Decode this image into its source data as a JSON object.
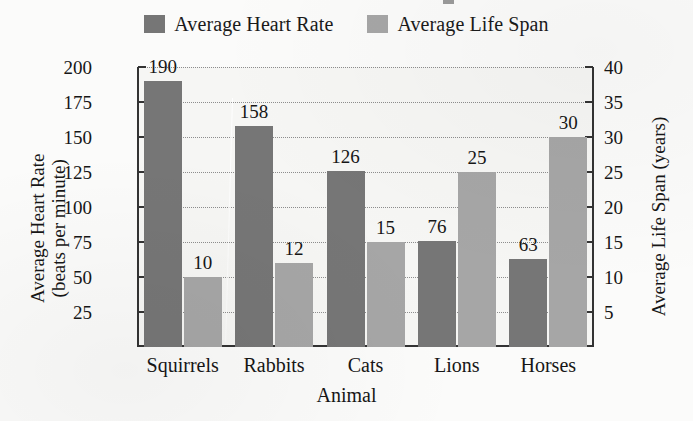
{
  "chart_data": {
    "type": "bar",
    "title": "",
    "xlabel": "Animal",
    "ylabel": "Average Heart Rate\n(beats per minute)",
    "ylabel_line1": "Average Heart Rate",
    "ylabel_line2": "(beats per minute)",
    "y2label": "Average Life Span (years)",
    "categories": [
      "Squirrels",
      "Rabbits",
      "Cats",
      "Lions",
      "Horses"
    ],
    "series": [
      {
        "name": "Average Heart Rate",
        "axis": "left",
        "unit": "beats per minute",
        "color": "#767676",
        "values": [
          190,
          158,
          126,
          76,
          63
        ]
      },
      {
        "name": "Average Life Span",
        "axis": "right",
        "unit": "years",
        "color": "#a6a6a6",
        "values": [
          10,
          12,
          15,
          25,
          30
        ]
      }
    ],
    "ylim": [
      0,
      200
    ],
    "yticks": [
      25,
      50,
      75,
      100,
      125,
      150,
      175,
      200
    ],
    "y2lim": [
      0,
      40
    ],
    "y2ticks": [
      5,
      10,
      15,
      20,
      25,
      30,
      35,
      40
    ],
    "grid": true,
    "grid_style": "dotted",
    "legend_position": "top-center",
    "data_labels": true,
    "plot_background": "#f6f6f4"
  },
  "legend": {
    "items": [
      {
        "label": "Average Heart Rate",
        "color": "#767676"
      },
      {
        "label": "Average Life Span",
        "color": "#a6a6a6"
      }
    ]
  },
  "axes": {
    "left": {
      "title_line1": "Average Heart Rate",
      "title_line2": "(beats per minute)",
      "ticks": [
        "200",
        "175",
        "150",
        "125",
        "100",
        "75",
        "50",
        "25"
      ]
    },
    "right": {
      "title": "Average Life Span (years)",
      "ticks": [
        "40",
        "35",
        "30",
        "25",
        "20",
        "15",
        "10",
        "5"
      ]
    },
    "bottom": {
      "title": "Animal",
      "ticks": [
        "Squirrels",
        "Rabbits",
        "Cats",
        "Lions",
        "Horses"
      ]
    }
  },
  "bar_labels": {
    "heart": [
      "190",
      "158",
      "126",
      "76",
      "63"
    ],
    "life": [
      "10",
      "12",
      "15",
      "25",
      "30"
    ]
  }
}
